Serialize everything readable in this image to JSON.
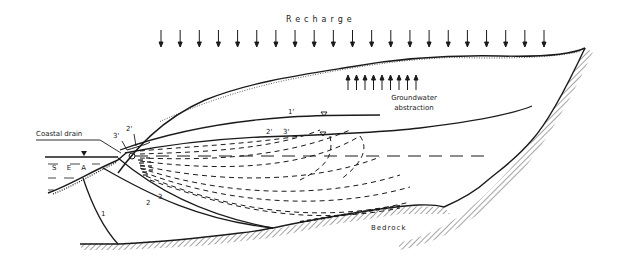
{
  "labels": {
    "recharge": "Recharge",
    "groundwater_abstraction_line1": "Groundwater",
    "groundwater_abstraction_line2": "abstraction",
    "coastal_drain": "Coastal drain",
    "sea": "S E A",
    "bedrock": "Bedrock"
  },
  "curve_labels": {
    "c1": "1",
    "c2": "2",
    "c3": "3",
    "c1p": "1'",
    "c2p_top": "2'",
    "c3p_top": "3'",
    "c2p_mid": "2'",
    "c3p_mid": "3'"
  },
  "symbols": {
    "water_table_marker": "inverted-triangle",
    "sea_level_marker": "filled-triangle",
    "recharge_arrows_count": 21,
    "abstraction_arrows_count": 9
  },
  "colors": {
    "ink": "#1a1a1a",
    "background": "#ffffff"
  }
}
